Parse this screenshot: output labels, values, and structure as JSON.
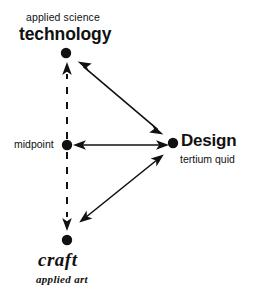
{
  "diagram": {
    "title_visible": false,
    "background_color": "#ffffff",
    "ink_color": "#111111",
    "nodes": [
      {
        "id": "technology",
        "name": "technology-node",
        "primary_label": "technology",
        "secondary_label": "applied science",
        "dot": {
          "x": 66,
          "y": 53,
          "r": 5
        }
      },
      {
        "id": "midpoint",
        "name": "midpoint-node",
        "primary_label": "midpoint",
        "secondary_label": "",
        "dot": {
          "x": 67,
          "y": 145,
          "r": 5
        }
      },
      {
        "id": "design",
        "name": "design-node",
        "primary_label": "Design",
        "secondary_label": "tertium quid",
        "dot": {
          "x": 173,
          "y": 143,
          "r": 5
        }
      },
      {
        "id": "craft",
        "name": "craft-node",
        "primary_label": "craft",
        "secondary_label": "applied art",
        "dot": {
          "x": 67,
          "y": 240,
          "r": 5
        }
      }
    ],
    "edges": [
      {
        "id": "midpoint-to-technology",
        "style": "dashed",
        "arrows": "single-end",
        "from": "midpoint",
        "to": "technology"
      },
      {
        "id": "midpoint-to-craft",
        "style": "dashed",
        "arrows": "single-end",
        "from": "midpoint",
        "to": "craft"
      },
      {
        "id": "midpoint-to-design",
        "style": "solid",
        "arrows": "double",
        "from": "midpoint",
        "to": "design"
      },
      {
        "id": "technology-to-design",
        "style": "solid",
        "arrows": "double",
        "from": "technology",
        "to": "design"
      },
      {
        "id": "craft-to-design",
        "style": "solid",
        "arrows": "double",
        "from": "craft",
        "to": "design"
      }
    ]
  },
  "labels": {
    "applied_science": "applied science",
    "technology": "technology",
    "midpoint": "midpoint",
    "design": "Design",
    "tertium_quid": "tertium quid",
    "craft": "craft",
    "applied_art": "applied art"
  }
}
